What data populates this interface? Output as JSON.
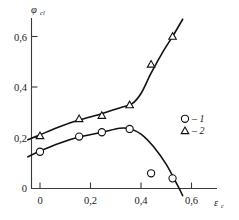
{
  "chart_data": {
    "type": "line",
    "title": "",
    "subtitle": "",
    "ylabel": "φ",
    "ylabel_sub": "cl",
    "xlabel": "ε",
    "xlabel_sub": "c",
    "xlim": [
      -0.05,
      0.72
    ],
    "ylim": [
      -0.03,
      0.68
    ],
    "xticks": [
      0,
      0.2,
      0.4,
      0.6
    ],
    "yticks": [
      0,
      0.2,
      0.4,
      0.6
    ],
    "xticklabels": [
      "0",
      "0,2",
      "0,4",
      "0,6"
    ],
    "yticklabels": [
      "0",
      "0,2",
      "0,4",
      "0,6"
    ],
    "grid": false,
    "legend_position": "middle-right",
    "decimal_separator": ",",
    "series": [
      {
        "name": "1",
        "marker": "circle",
        "points": [
          {
            "x": 0.0,
            "y": 0.145
          },
          {
            "x": 0.155,
            "y": 0.205
          },
          {
            "x": 0.245,
            "y": 0.222
          },
          {
            "x": 0.355,
            "y": 0.235
          },
          {
            "x": 0.44,
            "y": 0.06
          },
          {
            "x": 0.525,
            "y": 0.04
          }
        ],
        "curve": [
          {
            "x": -0.048,
            "y": 0.125
          },
          {
            "x": 0.0,
            "y": 0.148
          },
          {
            "x": 0.08,
            "y": 0.18
          },
          {
            "x": 0.155,
            "y": 0.203
          },
          {
            "x": 0.245,
            "y": 0.222
          },
          {
            "x": 0.315,
            "y": 0.238
          },
          {
            "x": 0.355,
            "y": 0.236
          },
          {
            "x": 0.4,
            "y": 0.215
          },
          {
            "x": 0.45,
            "y": 0.165
          },
          {
            "x": 0.5,
            "y": 0.095
          },
          {
            "x": 0.545,
            "y": 0.012
          },
          {
            "x": 0.565,
            "y": -0.028
          }
        ]
      },
      {
        "name": "2",
        "marker": "triangle",
        "points": [
          {
            "x": 0.0,
            "y": 0.208
          },
          {
            "x": 0.155,
            "y": 0.275
          },
          {
            "x": 0.245,
            "y": 0.288
          },
          {
            "x": 0.355,
            "y": 0.33
          },
          {
            "x": 0.44,
            "y": 0.49
          },
          {
            "x": 0.525,
            "y": 0.6
          }
        ],
        "curve": [
          {
            "x": -0.048,
            "y": 0.192
          },
          {
            "x": 0.0,
            "y": 0.212
          },
          {
            "x": 0.08,
            "y": 0.245
          },
          {
            "x": 0.155,
            "y": 0.27
          },
          {
            "x": 0.245,
            "y": 0.295
          },
          {
            "x": 0.315,
            "y": 0.318
          },
          {
            "x": 0.365,
            "y": 0.335
          },
          {
            "x": 0.4,
            "y": 0.375
          },
          {
            "x": 0.44,
            "y": 0.455
          },
          {
            "x": 0.49,
            "y": 0.545
          },
          {
            "x": 0.525,
            "y": 0.6
          },
          {
            "x": 0.565,
            "y": 0.668
          }
        ]
      }
    ],
    "legend": [
      {
        "marker": "circle",
        "separator": "–",
        "label": "1"
      },
      {
        "marker": "triangle",
        "separator": "–",
        "label": "2"
      }
    ]
  }
}
